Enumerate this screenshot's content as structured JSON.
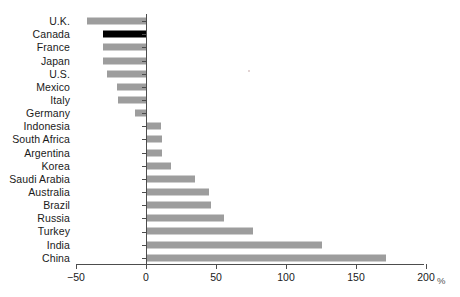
{
  "chart_data": {
    "type": "bar",
    "orientation": "horizontal",
    "title": "",
    "subtitle": "",
    "xlabel": "%",
    "ylabel": "",
    "xlim": [
      -50,
      200
    ],
    "xticks": [
      -50,
      0,
      50,
      100,
      150,
      200
    ],
    "xtick_labels": [
      "−50",
      "0",
      "50",
      "100",
      "150",
      "200"
    ],
    "grid": false,
    "legend": "none",
    "highlight_category": "Canada",
    "colors": {
      "bar": "#9d9d9d",
      "highlight_bar": "#000000",
      "axis": "#4d4d4d",
      "text": "#1a1a1a",
      "background": "#ffffff"
    },
    "categories": [
      "U.K.",
      "Canada",
      "France",
      "Japan",
      "U.S.",
      "Mexico",
      "Italy",
      "Germany",
      "Indonesia",
      "South Africa",
      "Argentina",
      "Korea",
      "Saudi Arabia",
      "Australia",
      "Brazil",
      "Russia",
      "Turkey",
      "India",
      "China"
    ],
    "values": [
      -42,
      -31,
      -31,
      -31,
      -28,
      -21,
      -20,
      -8,
      10,
      11,
      11,
      17,
      34,
      44,
      46,
      55,
      76,
      125,
      171
    ],
    "series": [
      {
        "name": "change",
        "values": [
          -42,
          -31,
          -31,
          -31,
          -28,
          -21,
          -20,
          -8,
          10,
          11,
          11,
          17,
          34,
          44,
          46,
          55,
          76,
          125,
          171
        ]
      }
    ]
  }
}
